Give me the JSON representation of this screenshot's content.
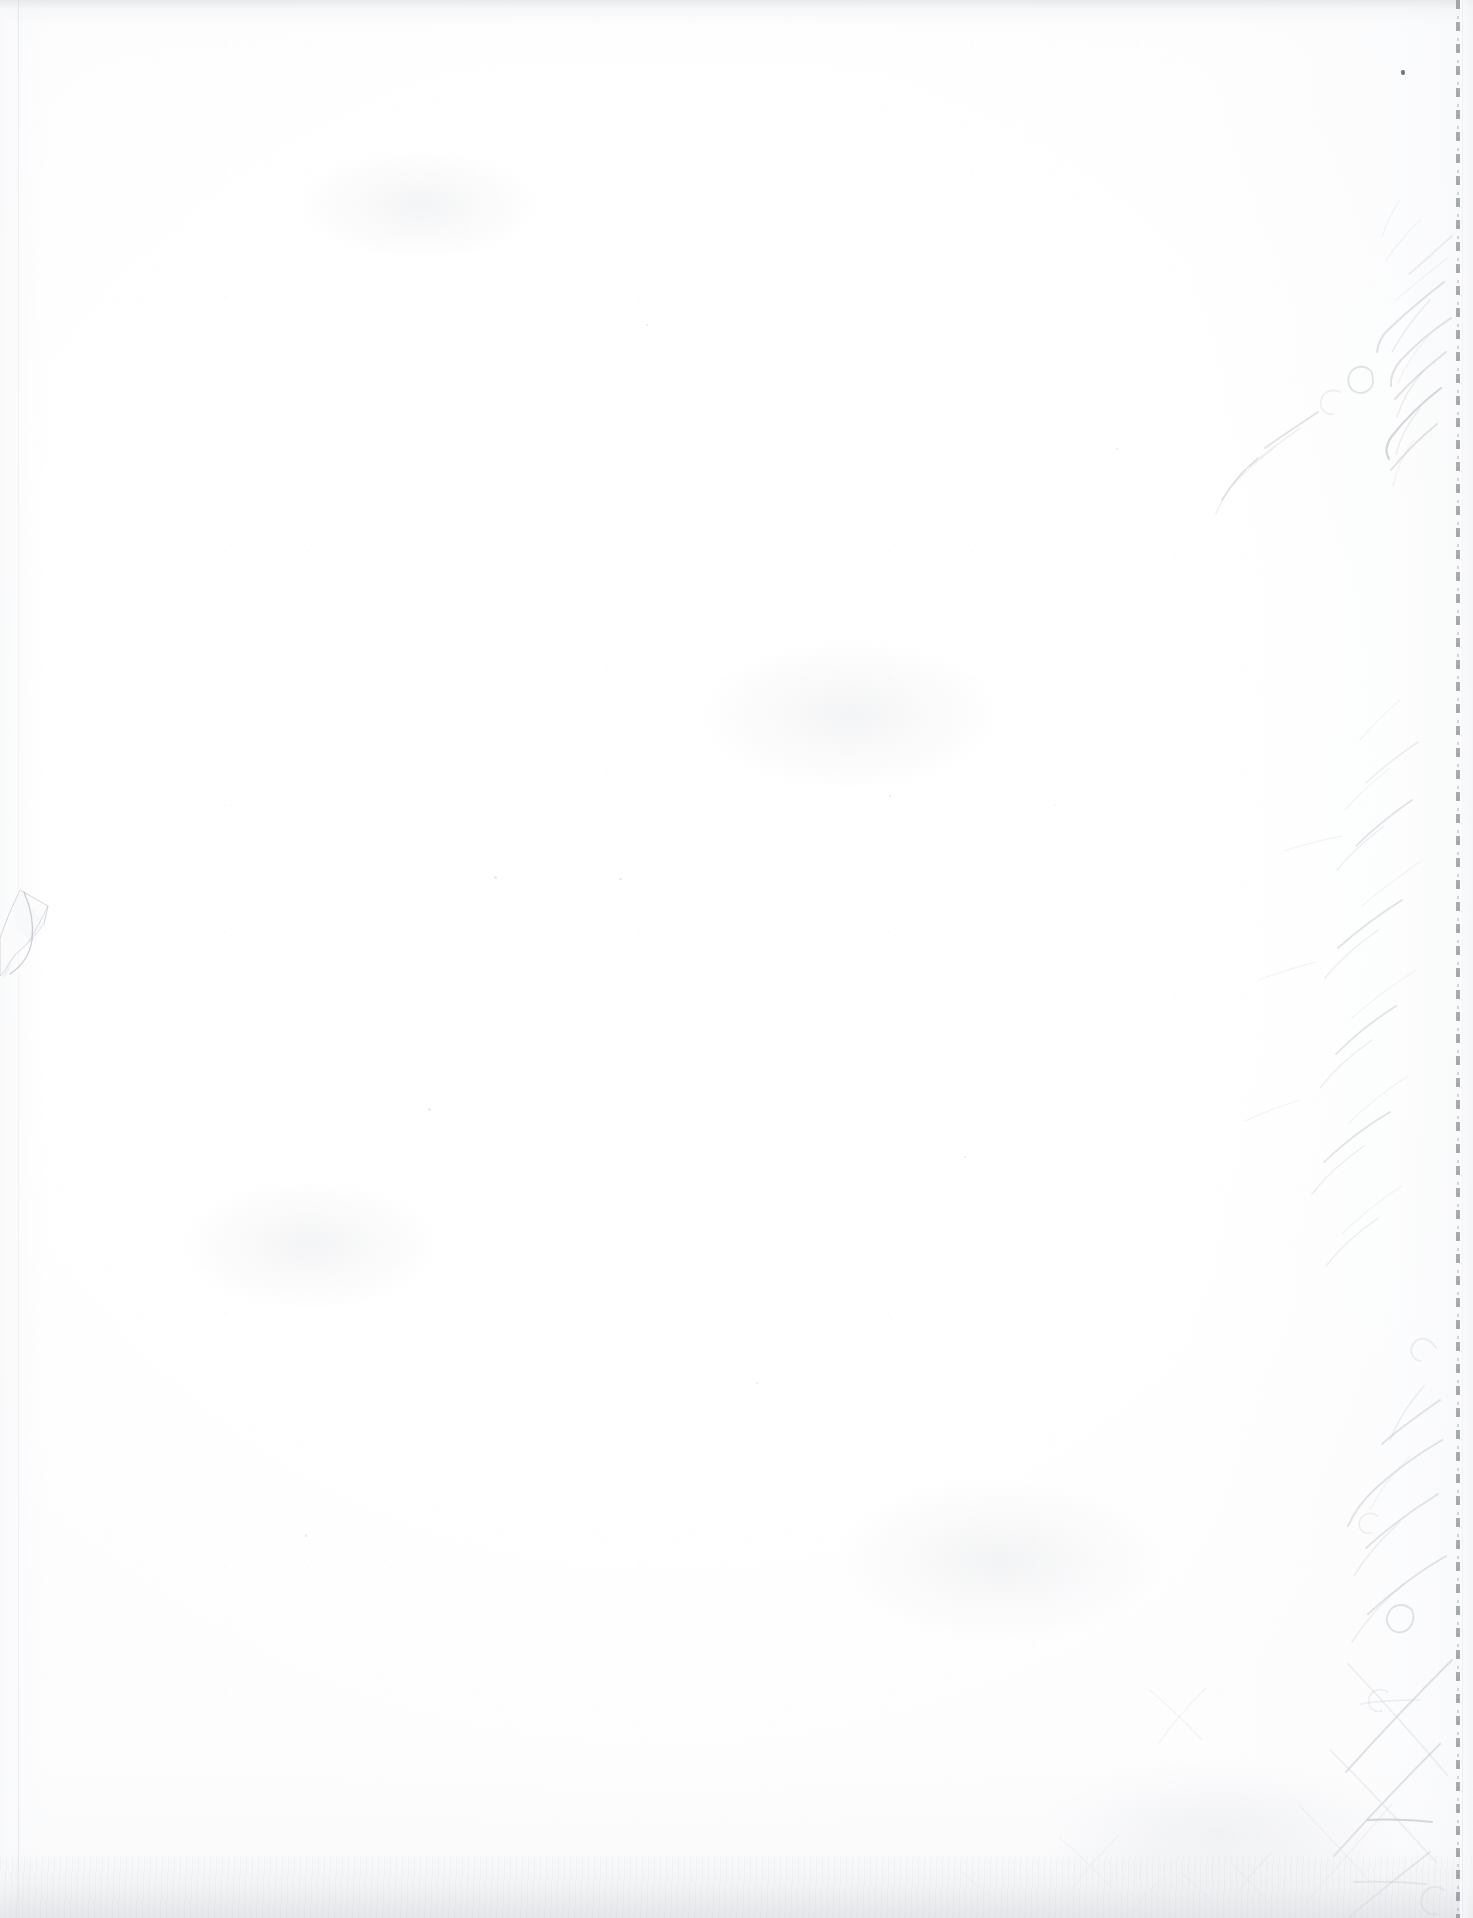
{
  "document": {
    "kind": "scanned-page",
    "description": "Scanned blank verso page of a perforated notebook sheet",
    "page_width": 1473,
    "page_height": 1918,
    "visible_text": "",
    "text_present": false,
    "caption": "Blank scanned notebook page with a perforated right edge and faint handwriting showing through from the reverse side."
  },
  "paper": {
    "base_color": "#ffffff",
    "tint_color": "#fdfdfe",
    "edge_shadow_color": "#e0e2e6",
    "grain_color": "#96989e",
    "has_visible_content": false
  },
  "edges": {
    "left": {
      "label": "left paper edge",
      "x": 18,
      "line_color": "#d6d8dc",
      "has_torn_flap": true
    },
    "top": {
      "label": "top scan band",
      "height": 9,
      "band_color": "#e0e2e6"
    },
    "bottom": {
      "label": "bottom scan band",
      "height": 96,
      "band_color": "#dfe2e5"
    },
    "right": {
      "label": "right perforated tear edge",
      "x": 1456
    }
  },
  "torn_flap": {
    "label": "torn corner flap",
    "x": 0,
    "y": 884,
    "width": 62,
    "height": 122,
    "fill_color": "#fbfbfc",
    "outline_color": "#b8bbc2"
  },
  "perforation": {
    "label": "tear-out perforation line",
    "x": 1456,
    "dash_color": "#767a82",
    "dot_color": "#969aa2",
    "crease_color": "#e2e4e8",
    "dash_length": 9,
    "gap_length": 13,
    "stub_width": 14,
    "stub_color": "#f3f4f6"
  },
  "showthrough": {
    "label": "verso handwriting show-through",
    "orientation": "rotated-90-sideways",
    "legible": false,
    "ink_color": "#b9bcc4",
    "ink_color_soft": "#cdd0d6",
    "ink_color_faint": "#dcdee3",
    "ink_color_dark": "#a7abb4",
    "region": {
      "x": 1180,
      "y": 40,
      "width": 290,
      "height": 1878
    },
    "stroke_clusters": [
      {
        "name": "upper-cluster",
        "y_start": 230,
        "y_end": 520
      },
      {
        "name": "mid-cluster",
        "y_start": 700,
        "y_end": 1260
      },
      {
        "name": "lower-cluster",
        "y_start": 1300,
        "y_end": 1918
      }
    ]
  },
  "artifacts": {
    "speck": {
      "label": "dark scanner speck",
      "x": 1402,
      "y": 71,
      "size": 4
    },
    "dust_count": 9,
    "smudge_count": 5
  }
}
